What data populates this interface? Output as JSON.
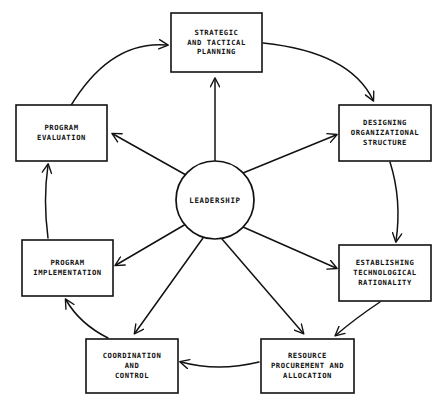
{
  "diagram": {
    "type": "cycle-diagram",
    "colors": {
      "background": "#ffffff",
      "stroke": "#121212",
      "text": "#111111"
    },
    "hub": {
      "label": "LEADERSHIP",
      "cx": 215,
      "cy": 200,
      "r": 39
    },
    "nodes": [
      {
        "id": "strategic-and-tactical-planning",
        "lines": [
          "STRATEGIC",
          "AND TACTICAL",
          "PLANNING"
        ],
        "x": 171,
        "y": 13,
        "w": 91,
        "h": 59
      },
      {
        "id": "designing-organizational-structure",
        "lines": [
          "DESIGNING",
          "ORGANIZATIONAL",
          "STRUCTURE"
        ],
        "x": 339,
        "y": 105,
        "w": 92,
        "h": 56
      },
      {
        "id": "establishing-technological-rationality",
        "lines": [
          "ESTABLISHING",
          "TECHNOLOGICAL",
          "RATIONALITY"
        ],
        "x": 339,
        "y": 245,
        "w": 92,
        "h": 56
      },
      {
        "id": "resource-procurement-and-allocation",
        "lines": [
          "RESOURCE",
          "PROCUREMENT AND",
          "ALLOCATION"
        ],
        "x": 261,
        "y": 339,
        "w": 93,
        "h": 54
      },
      {
        "id": "coordination-and-control",
        "lines": [
          "COORDINATION",
          "AND",
          "CONTROL"
        ],
        "x": 86,
        "y": 339,
        "w": 92,
        "h": 54
      },
      {
        "id": "program-implementation",
        "lines": [
          "PROGRAM",
          "IMPLEMENTATION"
        ],
        "x": 22,
        "y": 240,
        "w": 91,
        "h": 56
      },
      {
        "id": "program-evaluation",
        "lines": [
          "PROGRAM",
          "EVALUATION"
        ],
        "x": 16,
        "y": 105,
        "w": 91,
        "h": 56
      }
    ],
    "spokes": [
      {
        "id": "hub-to-strategic-and-tactical-planning",
        "d": "M 215 161 L 215 79"
      },
      {
        "id": "hub-to-designing-organizational-structure",
        "d": "M 243 173 L 336 135"
      },
      {
        "id": "hub-to-establishing-technological-rationality",
        "d": "M 243 227 L 336 268"
      },
      {
        "id": "hub-to-resource-procurement-and-allocation",
        "d": "M 222 239 L 303 333"
      },
      {
        "id": "hub-to-coordination-and-control",
        "d": "M 203 238 L 135 333"
      },
      {
        "id": "hub-to-program-implementation",
        "d": "M 186 224 L 116 265"
      },
      {
        "id": "hub-to-program-evaluation",
        "d": "M 186 175 L 113 134"
      }
    ],
    "arcs": [
      {
        "id": "program-evaluation-to-strategic-planning",
        "d": "M 70 107 Q 110 40 167 45"
      },
      {
        "id": "strategic-planning-to-designing-structure",
        "d": "M 263 43 Q 350 52 373 100"
      },
      {
        "id": "designing-structure-to-establishing-rationality",
        "d": "M 390 162 Q 402 200 396 241"
      },
      {
        "id": "establishing-rationality-to-resource-procurement",
        "d": "M 380 302 Q 356 318 336 335"
      },
      {
        "id": "resource-procurement-to-coordination-control",
        "d": "M 259 362 Q 218 372 181 362"
      },
      {
        "id": "coordination-control-to-program-implementation",
        "d": "M 108 338 Q 80 324 66 300"
      },
      {
        "id": "program-implementation-to-program-evaluation",
        "d": "M 48 238 Q 43 200 48 165"
      }
    ]
  }
}
